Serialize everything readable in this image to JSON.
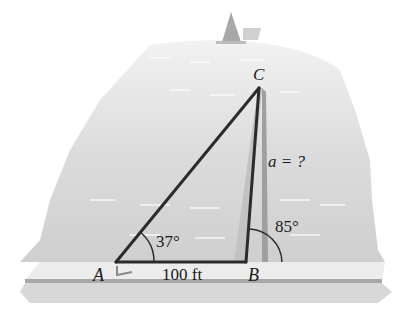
{
  "figure": {
    "labels": {
      "vertex_a": "A",
      "vertex_b": "B",
      "vertex_c": "C",
      "side_ab": "100 ft",
      "side_a": "a = ?",
      "angle_a": "37°",
      "angle_b_ext": "85°"
    },
    "colors": {
      "water": "#d6d6d6",
      "shore": "#e9e9e9",
      "ground": "#b8b8b8",
      "line": "#2a2a2a",
      "shadow": "#b0b0b0"
    }
  }
}
